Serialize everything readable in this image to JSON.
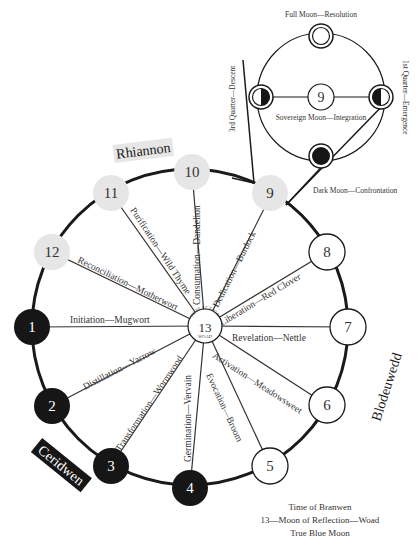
{
  "colors": {
    "ink": "#1a1a1a",
    "dark_node": "#161616",
    "light_node": "#e6e6e6",
    "white_node": "#ffffff",
    "label": "#333333"
  },
  "center": {
    "number": "13",
    "top_label": "REFLECTION",
    "bottom_label": "WOAD"
  },
  "nodes": [
    {
      "num": "1",
      "style": "dark",
      "spoke": "Initiation—Mugwort"
    },
    {
      "num": "2",
      "style": "dark",
      "spoke": "Distillation—Yarrow"
    },
    {
      "num": "3",
      "style": "dark",
      "spoke": "Transformation—Wormwood"
    },
    {
      "num": "4",
      "style": "dark",
      "spoke": "Germination—Vervain"
    },
    {
      "num": "5",
      "style": "white",
      "spoke": "Evocation—Broom"
    },
    {
      "num": "6",
      "style": "white",
      "spoke": "Activation—Meadowsweet"
    },
    {
      "num": "7",
      "style": "white",
      "spoke": "Revelation—Nettle"
    },
    {
      "num": "8",
      "style": "white",
      "spoke": "Liberation—Red Clover"
    },
    {
      "num": "9",
      "style": "light",
      "spoke": "Dedication—Burdock"
    },
    {
      "num": "10",
      "style": "light",
      "spoke": "Consumation—Dandelion"
    },
    {
      "num": "11",
      "style": "light",
      "spoke": "Purification—Wild Thyme"
    },
    {
      "num": "12",
      "style": "light",
      "spoke": "Reconciliation—Motherwort"
    }
  ],
  "goddesses": {
    "top": "Rhiannon",
    "right": "Blodeuwedd",
    "left": "Ceridwen"
  },
  "inset": {
    "center_number": "9",
    "full_moon": "Full Moon—Resolution",
    "first_quarter": "1st Quarter—Emergence",
    "third_quarter": "3rd Quarter—Descent",
    "dark_moon": "Dark Moon—Confrontation",
    "sovereign": "Sovereign Moon—Integration"
  },
  "footer": {
    "line1": "Time of Branwen",
    "line2": "13—Moon of Reflection—Woad",
    "line3": "True Blue Moon"
  }
}
